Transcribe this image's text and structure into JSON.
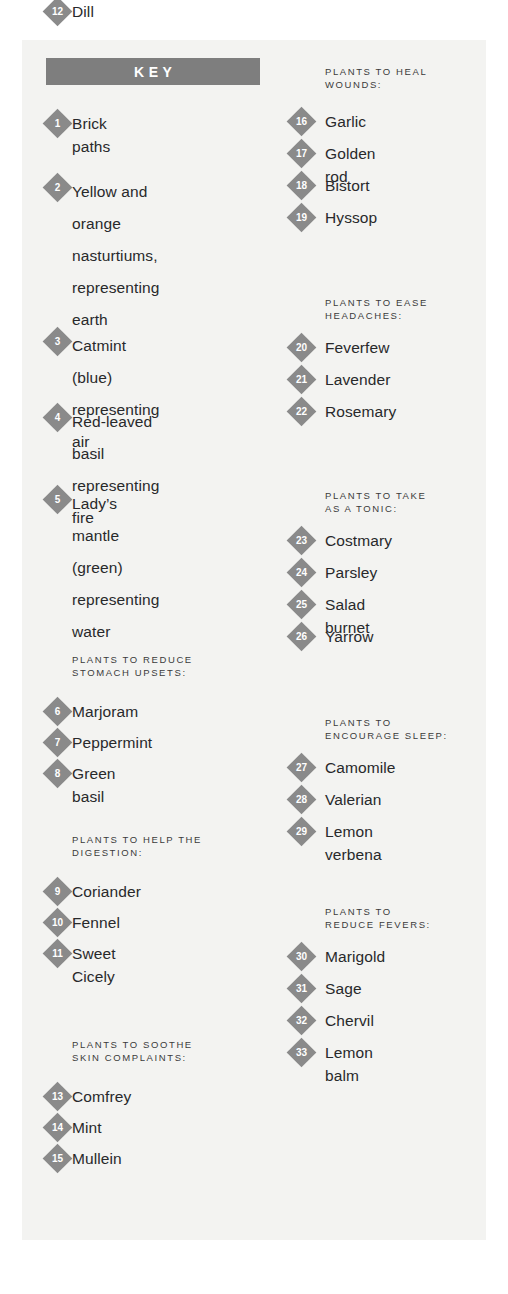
{
  "header": {
    "title": "KEY"
  },
  "colors": {
    "banner_gray": "#7e7e7e",
    "marker_gray": "#8a8a8a",
    "paper": "#f3f3f1",
    "text": "#28292b",
    "heading_text": "#3b3b3b"
  },
  "left_column": {
    "elemental_items": [
      {
        "number": "1",
        "label": "Brick paths"
      },
      {
        "number": "2",
        "label": "Yellow and orange\nnasturtiums,\nrepresenting earth"
      },
      {
        "number": "3",
        "label": "Catmint (blue)\nrepresenting air"
      },
      {
        "number": "4",
        "label": "Red-leaved basil\nrepresenting fire"
      },
      {
        "number": "5",
        "label": "Lady’s mantle\n(green) representing\nwater"
      }
    ],
    "sections": [
      {
        "heading": "PLANTS TO REDUCE\nSTOMACH UPSETS:",
        "items": [
          {
            "number": "6",
            "label": "Marjoram"
          },
          {
            "number": "7",
            "label": "Peppermint"
          },
          {
            "number": "8",
            "label": "Green basil"
          }
        ]
      },
      {
        "heading": "PLANTS TO HELP THE\nDIGESTION:",
        "items": [
          {
            "number": "9",
            "label": "Coriander"
          },
          {
            "number": "10",
            "label": "Fennel"
          },
          {
            "number": "11",
            "label": "Sweet Cicely"
          },
          {
            "number": "12",
            "label": "Dill"
          }
        ]
      },
      {
        "heading": "PLANTS TO SOOTHE\nSKIN COMPLAINTS:",
        "items": [
          {
            "number": "13",
            "label": "Comfrey"
          },
          {
            "number": "14",
            "label": "Mint"
          },
          {
            "number": "15",
            "label": "Mullein"
          }
        ]
      }
    ]
  },
  "right_column": {
    "sections": [
      {
        "heading": "PLANTS TO HEAL\nWOUNDS:",
        "items": [
          {
            "number": "16",
            "label": "Garlic"
          },
          {
            "number": "17",
            "label": "Golden rod"
          },
          {
            "number": "18",
            "label": "Bistort"
          },
          {
            "number": "19",
            "label": "Hyssop"
          }
        ]
      },
      {
        "heading": "PLANTS TO EASE\nHEADACHES:",
        "items": [
          {
            "number": "20",
            "label": "Feverfew"
          },
          {
            "number": "21",
            "label": "Lavender"
          },
          {
            "number": "22",
            "label": "Rosemary"
          }
        ]
      },
      {
        "heading": "PLANTS TO TAKE\nAS A TONIC:",
        "items": [
          {
            "number": "23",
            "label": "Costmary"
          },
          {
            "number": "24",
            "label": "Parsley"
          },
          {
            "number": "25",
            "label": "Salad burnet"
          },
          {
            "number": "26",
            "label": "Yarrow"
          }
        ]
      },
      {
        "heading": "PLANTS TO\nENCOURAGE SLEEP:",
        "items": [
          {
            "number": "27",
            "label": "Camomile"
          },
          {
            "number": "28",
            "label": "Valerian"
          },
          {
            "number": "29",
            "label": "Lemon verbena"
          }
        ]
      },
      {
        "heading": "PLANTS TO\nREDUCE FEVERS:",
        "items": [
          {
            "number": "30",
            "label": "Marigold"
          },
          {
            "number": "31",
            "label": "Sage"
          },
          {
            "number": "32",
            "label": "Chervil"
          },
          {
            "number": "33",
            "label": "Lemon balm"
          }
        ]
      }
    ]
  },
  "layout": {
    "left_x_marker": 46,
    "left_x_text": 72,
    "right_x_marker": 290,
    "right_x_text": 325,
    "elemental_tops": [
      112,
      176,
      330,
      406,
      488
    ],
    "left_section_head_tops": [
      653,
      833,
      1038
    ],
    "left_section_item_tops": [
      [
        700,
        731,
        762
      ],
      [
        880,
        911,
        942
      ],
      [
        1085,
        1116,
        1147
      ]
    ],
    "right_section_head_tops": [
      65,
      296,
      489,
      716,
      905
    ],
    "right_section_item_tops": [
      [
        110,
        142,
        174,
        206
      ],
      [
        336,
        368,
        400
      ],
      [
        529,
        561,
        593,
        625
      ],
      [
        756,
        788,
        820
      ],
      [
        945,
        977,
        1009,
        1041
      ]
    ]
  }
}
